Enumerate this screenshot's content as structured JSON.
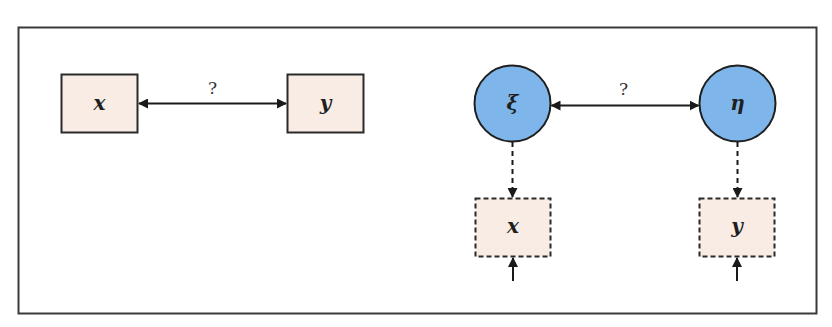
{
  "colors": {
    "frame_stroke": "#3a3a3a",
    "box_fill": "#f8ece4",
    "box_stroke": "#2a2a2a",
    "circle_fill": "#7eb6ec",
    "circle_stroke": "#1f1f1f",
    "arrow": "#1a1a1a"
  },
  "left_panel": {
    "observed_x": {
      "label": "x"
    },
    "observed_y": {
      "label": "y"
    },
    "relation": {
      "label": "?"
    }
  },
  "right_panel": {
    "latent_xi": {
      "label": "ξ"
    },
    "latent_eta": {
      "label": "η"
    },
    "relation": {
      "label": "?"
    },
    "indicator_x": {
      "label": "x"
    },
    "indicator_y": {
      "label": "y"
    }
  }
}
